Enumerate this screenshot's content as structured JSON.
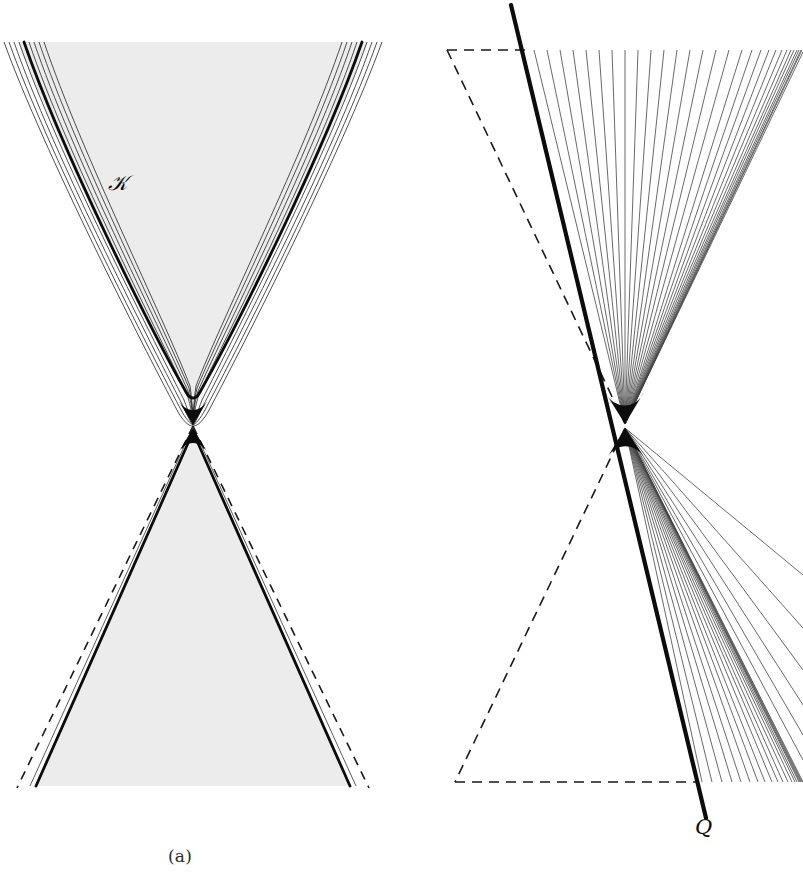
{
  "figure": {
    "type": "mathematical-diagram",
    "width": 803,
    "height": 886,
    "background_color": "#ffffff",
    "panel_count": 2
  },
  "panels": [
    {
      "id": "a",
      "caption": "(a)",
      "caption_center_x": 190,
      "caption_y": 860,
      "description": "Shaded bow-tie / double-cone region with a smooth hyperbolic boundary above the waist and a straight-sided triangular region below; dashed asymptotic lines bound the lower cone.",
      "labels": [
        {
          "name": "horizon-label",
          "text": "ℋ",
          "plain": "H",
          "x": 118,
          "y": 187,
          "style": "script"
        }
      ],
      "shading": {
        "fill_color": "#ececec",
        "stroke_color": "#111111"
      },
      "elements": [
        "shaded-upper-cone",
        "shaded-lower-cone",
        "thick-hyperbola-boundary",
        "thin-hyperbola-family",
        "dashed-asymptote-lines"
      ],
      "geometry": {
        "waist_x": 193,
        "waist_y": 425,
        "top_y": 42,
        "bottom_y": 786,
        "upper_half_width": 188,
        "lower_half_width": 160,
        "hyperbola_family_count": 9,
        "thick_curve_index": 4
      }
    },
    {
      "id": "b",
      "caption": "(b)",
      "caption_center_x": 625,
      "caption_y": 860,
      "description": "A thick straight null line crossing a fan of thin straight rays that converge at the waist; dashed triangles mark the complementary reference wedges.",
      "labels": [
        {
          "name": "null-line-label",
          "text": "𝑄",
          "plain": "Q",
          "x": 703,
          "y": 826,
          "style": "script"
        }
      ],
      "shading": {
        "fill_color": "none",
        "stroke_color": "#111111"
      },
      "elements": [
        "thick-null-line",
        "thin-ray-fan-upper",
        "thin-ray-fan-lower",
        "dashed-triangle-upper",
        "dashed-triangle-lower"
      ],
      "geometry": {
        "waist_x": 625,
        "waist_y": 425,
        "thick_line_top": {
          "x": 511,
          "y": 5
        },
        "thick_line_bottom": {
          "x": 706,
          "y": 818
        },
        "dashed_top_y": 50,
        "dashed_bottom_y": 782,
        "dashed_left_top_x": 448,
        "dashed_left_bottom_x": 455,
        "ray_count_upper": 30,
        "ray_count_lower": 26,
        "fan_right_top_x": 800,
        "fan_right_bottom_x": 800
      }
    }
  ],
  "colors": {
    "ink": "#111111",
    "shade": "#ececec",
    "caption": "#2b2b2b",
    "thin_line": "#3c3c3c",
    "background": "#ffffff"
  }
}
